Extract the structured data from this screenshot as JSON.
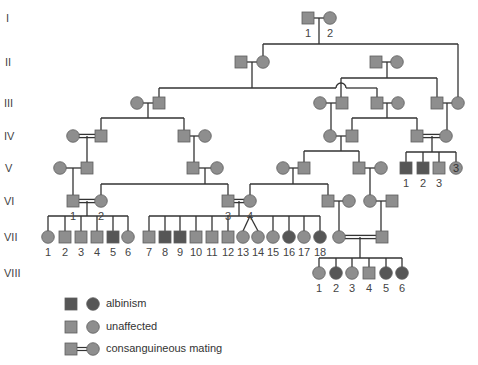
{
  "colors": {
    "unaffected": "#8e8e8e",
    "affected": "#565656",
    "stroke": "#5e5e5e",
    "line": "#333333",
    "label": "#444444"
  },
  "generations": [
    {
      "label": "I",
      "y": 18
    },
    {
      "label": "II",
      "y": 62
    },
    {
      "label": "III",
      "y": 103
    },
    {
      "label": "IV",
      "y": 136
    },
    {
      "label": "V",
      "y": 168
    },
    {
      "label": "VI",
      "y": 201
    },
    {
      "label": "VII",
      "y": 237
    },
    {
      "label": "VIII",
      "y": 273
    }
  ],
  "individuals": [
    {
      "id": "I-1",
      "sex": "M",
      "x": 308,
      "y": 18,
      "affected": false,
      "label": "1"
    },
    {
      "id": "I-2",
      "sex": "F",
      "x": 330,
      "y": 18,
      "affected": false,
      "label": "2"
    },
    {
      "id": "II-a",
      "sex": "M",
      "x": 241,
      "y": 62,
      "affected": false
    },
    {
      "id": "II-b",
      "sex": "F",
      "x": 263,
      "y": 62,
      "affected": false
    },
    {
      "id": "II-c",
      "sex": "M",
      "x": 376,
      "y": 62,
      "affected": false
    },
    {
      "id": "II-d",
      "sex": "F",
      "x": 397,
      "y": 62,
      "affected": false
    },
    {
      "id": "III-a",
      "sex": "F",
      "x": 137,
      "y": 103,
      "affected": false
    },
    {
      "id": "III-b",
      "sex": "M",
      "x": 159,
      "y": 103,
      "affected": false
    },
    {
      "id": "III-c",
      "sex": "F",
      "x": 320,
      "y": 103,
      "affected": false
    },
    {
      "id": "III-d",
      "sex": "M",
      "x": 342,
      "y": 103,
      "affected": false
    },
    {
      "id": "III-e",
      "sex": "M",
      "x": 377,
      "y": 103,
      "affected": false
    },
    {
      "id": "III-f",
      "sex": "F",
      "x": 398,
      "y": 103,
      "affected": false
    },
    {
      "id": "III-g",
      "sex": "M",
      "x": 437,
      "y": 103,
      "affected": false
    },
    {
      "id": "III-h",
      "sex": "F",
      "x": 458,
      "y": 103,
      "affected": false
    },
    {
      "id": "IV-a",
      "sex": "F",
      "x": 73,
      "y": 136,
      "affected": false
    },
    {
      "id": "IV-b",
      "sex": "M",
      "x": 101,
      "y": 136,
      "affected": false
    },
    {
      "id": "IV-c",
      "sex": "M",
      "x": 184,
      "y": 136,
      "affected": false
    },
    {
      "id": "IV-d",
      "sex": "F",
      "x": 205,
      "y": 136,
      "affected": false
    },
    {
      "id": "IV-e",
      "sex": "F",
      "x": 330,
      "y": 136,
      "affected": false
    },
    {
      "id": "IV-f",
      "sex": "M",
      "x": 352,
      "y": 136,
      "affected": false
    },
    {
      "id": "IV-g",
      "sex": "M",
      "x": 417,
      "y": 136,
      "affected": false
    },
    {
      "id": "IV-h",
      "sex": "F",
      "x": 446,
      "y": 136,
      "affected": false
    },
    {
      "id": "V-a",
      "sex": "F",
      "x": 60,
      "y": 168,
      "affected": false
    },
    {
      "id": "V-b",
      "sex": "M",
      "x": 87,
      "y": 168,
      "affected": false
    },
    {
      "id": "V-c",
      "sex": "M",
      "x": 193,
      "y": 168,
      "affected": false
    },
    {
      "id": "V-d",
      "sex": "F",
      "x": 217,
      "y": 168,
      "affected": false
    },
    {
      "id": "V-e",
      "sex": "F",
      "x": 283,
      "y": 168,
      "affected": false
    },
    {
      "id": "V-f",
      "sex": "M",
      "x": 304,
      "y": 168,
      "affected": false
    },
    {
      "id": "V-g",
      "sex": "M",
      "x": 359,
      "y": 168,
      "affected": false
    },
    {
      "id": "V-h",
      "sex": "F",
      "x": 381,
      "y": 168,
      "affected": false
    },
    {
      "id": "V-1",
      "sex": "M",
      "x": 406,
      "y": 168,
      "affected": true,
      "label": "1"
    },
    {
      "id": "V-2",
      "sex": "M",
      "x": 423,
      "y": 168,
      "affected": true,
      "label": "2"
    },
    {
      "id": "V-3",
      "sex": "M",
      "x": 439,
      "y": 168,
      "affected": false,
      "label": "3"
    },
    {
      "id": "V-group",
      "sex": "F",
      "x": 456,
      "y": 168,
      "affected": false,
      "count": "3"
    },
    {
      "id": "VI-1",
      "sex": "M",
      "x": 73,
      "y": 201,
      "affected": false,
      "label": "1"
    },
    {
      "id": "VI-2",
      "sex": "F",
      "x": 101,
      "y": 201,
      "affected": false,
      "label": "2"
    },
    {
      "id": "VI-3",
      "sex": "M",
      "x": 228,
      "y": 201,
      "affected": false,
      "label": "3"
    },
    {
      "id": "VI-4",
      "sex": "F",
      "x": 250,
      "y": 201,
      "affected": false,
      "label": "4"
    },
    {
      "id": "VI-a",
      "sex": "M",
      "x": 328,
      "y": 201,
      "affected": false
    },
    {
      "id": "VI-b",
      "sex": "F",
      "x": 349,
      "y": 201,
      "affected": false
    },
    {
      "id": "VI-c",
      "sex": "F",
      "x": 370,
      "y": 201,
      "affected": false
    },
    {
      "id": "VI-d",
      "sex": "M",
      "x": 392,
      "y": 201,
      "affected": false
    },
    {
      "id": "VII-1",
      "sex": "F",
      "x": 48,
      "y": 237,
      "affected": false,
      "label": "1"
    },
    {
      "id": "VII-2",
      "sex": "M",
      "x": 65,
      "y": 237,
      "affected": false,
      "label": "2"
    },
    {
      "id": "VII-3",
      "sex": "M",
      "x": 81,
      "y": 237,
      "affected": false,
      "label": "3"
    },
    {
      "id": "VII-4",
      "sex": "M",
      "x": 97,
      "y": 237,
      "affected": false,
      "label": "4"
    },
    {
      "id": "VII-5",
      "sex": "M",
      "x": 113,
      "y": 237,
      "affected": true,
      "label": "5"
    },
    {
      "id": "VII-6",
      "sex": "F",
      "x": 128,
      "y": 237,
      "affected": false,
      "label": "6"
    },
    {
      "id": "VII-7",
      "sex": "M",
      "x": 149,
      "y": 237,
      "affected": false,
      "label": "7"
    },
    {
      "id": "VII-8",
      "sex": "M",
      "x": 165,
      "y": 237,
      "affected": true,
      "label": "8"
    },
    {
      "id": "VII-9",
      "sex": "M",
      "x": 180,
      "y": 237,
      "affected": true,
      "label": "9"
    },
    {
      "id": "VII-10",
      "sex": "M",
      "x": 196,
      "y": 237,
      "affected": false,
      "label": "10"
    },
    {
      "id": "VII-11",
      "sex": "M",
      "x": 212,
      "y": 237,
      "affected": false,
      "label": "11"
    },
    {
      "id": "VII-12",
      "sex": "M",
      "x": 228,
      "y": 237,
      "affected": false,
      "label": "12"
    },
    {
      "id": "VII-13",
      "sex": "F",
      "x": 243,
      "y": 237,
      "affected": false,
      "label": "13"
    },
    {
      "id": "VII-14",
      "sex": "F",
      "x": 258,
      "y": 237,
      "affected": false,
      "label": "14"
    },
    {
      "id": "VII-15",
      "sex": "F",
      "x": 273,
      "y": 237,
      "affected": false,
      "label": "15"
    },
    {
      "id": "VII-16",
      "sex": "F",
      "x": 289,
      "y": 237,
      "affected": true,
      "label": "16"
    },
    {
      "id": "VII-17",
      "sex": "F",
      "x": 304,
      "y": 237,
      "affected": false,
      "label": "17"
    },
    {
      "id": "VII-18",
      "sex": "F",
      "x": 320,
      "y": 237,
      "affected": true,
      "label": "18"
    },
    {
      "id": "VII-a",
      "sex": "F",
      "x": 339,
      "y": 237,
      "affected": false
    },
    {
      "id": "VII-b",
      "sex": "M",
      "x": 382,
      "y": 237,
      "affected": false
    },
    {
      "id": "VIII-1",
      "sex": "F",
      "x": 319,
      "y": 273,
      "affected": false,
      "label": "1"
    },
    {
      "id": "VIII-2",
      "sex": "F",
      "x": 336,
      "y": 273,
      "affected": true,
      "label": "2"
    },
    {
      "id": "VIII-3",
      "sex": "F",
      "x": 352,
      "y": 273,
      "affected": false,
      "label": "3"
    },
    {
      "id": "VIII-4",
      "sex": "M",
      "x": 369,
      "y": 273,
      "affected": false,
      "label": "4"
    },
    {
      "id": "VIII-5",
      "sex": "F",
      "x": 386,
      "y": 273,
      "affected": true,
      "label": "5"
    },
    {
      "id": "VIII-6",
      "sex": "F",
      "x": 402,
      "y": 273,
      "affected": true,
      "label": "6"
    }
  ],
  "matings": [
    {
      "a": "I-1",
      "b": "I-2",
      "consanguineous": false
    },
    {
      "a": "II-a",
      "b": "II-b",
      "consanguineous": false
    },
    {
      "a": "II-c",
      "b": "II-d",
      "consanguineous": false
    },
    {
      "a": "III-a",
      "b": "III-b",
      "consanguineous": false
    },
    {
      "a": "III-c",
      "b": "III-d",
      "consanguineous": false
    },
    {
      "a": "III-e",
      "b": "III-f",
      "consanguineous": false
    },
    {
      "a": "III-g",
      "b": "III-h",
      "consanguineous": false
    },
    {
      "a": "IV-a",
      "b": "IV-b",
      "consanguineous": true
    },
    {
      "a": "IV-c",
      "b": "IV-d",
      "consanguineous": false
    },
    {
      "a": "IV-e",
      "b": "IV-f",
      "consanguineous": false
    },
    {
      "a": "IV-g",
      "b": "IV-h",
      "consanguineous": true
    },
    {
      "a": "V-a",
      "b": "V-b",
      "consanguineous": false
    },
    {
      "a": "V-c",
      "b": "V-d",
      "consanguineous": false
    },
    {
      "a": "V-e",
      "b": "V-f",
      "consanguineous": false
    },
    {
      "a": "V-g",
      "b": "V-h",
      "consanguineous": false
    },
    {
      "a": "VI-1",
      "b": "VI-2",
      "consanguineous": true
    },
    {
      "a": "VI-3",
      "b": "VI-4",
      "consanguineous": true
    },
    {
      "a": "VI-a",
      "b": "VI-b",
      "consanguineous": false
    },
    {
      "a": "VI-c",
      "b": "VI-d",
      "consanguineous": false
    },
    {
      "a": "VII-a",
      "b": "VII-b",
      "consanguineous": true
    }
  ],
  "twins": [
    [
      "VII-13",
      "VII-14"
    ]
  ],
  "legend": {
    "items": [
      {
        "label": "albinism",
        "type": "affected"
      },
      {
        "label": "unaffected",
        "type": "unaffected"
      },
      {
        "label": "consanguineous mating",
        "type": "consanguineous"
      }
    ]
  }
}
